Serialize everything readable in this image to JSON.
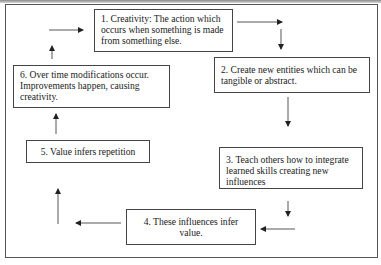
{
  "diagram": {
    "type": "cycle-flowchart",
    "steps": [
      {
        "id": 1,
        "label": "1. Creativity: The action which occurs when something is made from something else."
      },
      {
        "id": 2,
        "label": "2. Create new entities which can be tangible or abstract."
      },
      {
        "id": 3,
        "label": "3. Teach others how to integrate learned skills creating new influences"
      },
      {
        "id": 4,
        "label": "4. These influences infer value."
      },
      {
        "id": 5,
        "label": "5.  Value infers repetition"
      },
      {
        "id": 6,
        "label": "6. Over time modifications occur. Improvements happen, causing creativity."
      }
    ],
    "flow": [
      "1→2",
      "2→3",
      "3→4",
      "4→5",
      "5→6",
      "6→1"
    ],
    "colors": {
      "line": "#444444",
      "text": "#1a1a1a",
      "background": "#ffffff"
    }
  }
}
